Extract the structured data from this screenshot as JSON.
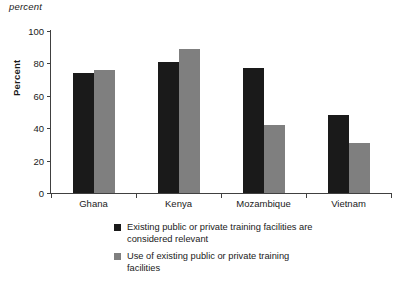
{
  "unit_caption": "percent",
  "chart_data": {
    "type": "bar",
    "title": "",
    "subtitle": "",
    "unit_caption": "percent",
    "xlabel": "",
    "ylabel": "Percent",
    "ylim": [
      0,
      100
    ],
    "yticks": [
      0,
      20,
      40,
      60,
      80,
      100
    ],
    "ytick_labels": [
      "0",
      "20",
      "40",
      "60",
      "80",
      "100"
    ],
    "grid": false,
    "legend_position": "below-axis-left",
    "categories": [
      "Ghana",
      "Kenya",
      "Mozambique",
      "Vietnam"
    ],
    "series": [
      {
        "name": "Existing public or private training facilities are considered relevant",
        "color": "#1a1a1a",
        "values": [
          74,
          81,
          77,
          48
        ]
      },
      {
        "name": "Use of existing public or private training facilities",
        "color": "#7f7f7f",
        "values": [
          76,
          89,
          42,
          31
        ]
      }
    ]
  },
  "legend": {
    "items": [
      {
        "line1": "Existing public or private training facilities are",
        "line2": "considered relevant",
        "swatch": "dark-square-swatch"
      },
      {
        "line1": "Use of existing public or private training",
        "line2": "facilities",
        "swatch": "gray-square-swatch"
      }
    ]
  },
  "colors": {
    "series_dark": "#1a1a1a",
    "series_gray": "#7f7f7f",
    "axis": "#404040",
    "background": "#ffffff"
  }
}
